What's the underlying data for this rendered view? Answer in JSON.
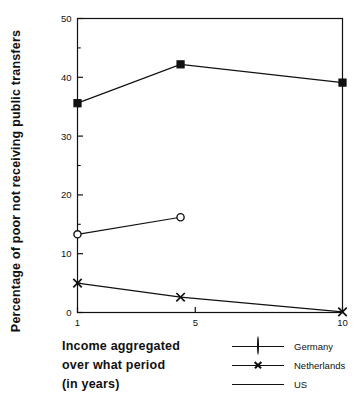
{
  "chart_data": {
    "type": "line",
    "title": "",
    "xlabel": "Income aggregated over what period (in years)",
    "ylabel": "Percentage of poor not receiving public transfers",
    "xlim": [
      1,
      10
    ],
    "ylim": [
      0,
      50
    ],
    "xticks": [
      1,
      5,
      10
    ],
    "xtick_labels": [
      "1",
      "5",
      "10"
    ],
    "yticks": [
      0,
      10,
      20,
      30,
      40,
      50
    ],
    "ytick_labels": [
      "0",
      "10",
      "20",
      "30",
      "40",
      "50"
    ],
    "yminor_ticks": [
      5,
      15,
      25,
      35,
      45
    ],
    "grid": false,
    "legend_position": "bottom-right",
    "series": [
      {
        "name": "Germany",
        "marker": "open-circle",
        "x": [
          1,
          4.5
        ],
        "values": [
          13.3,
          16.2
        ]
      },
      {
        "name": "Netherlands",
        "marker": "cross",
        "x": [
          1,
          4.5,
          10
        ],
        "values": [
          5.0,
          2.6,
          0.1
        ]
      },
      {
        "name": "US",
        "marker": "filled-square",
        "x": [
          1,
          4.5,
          10
        ],
        "values": [
          35.6,
          42.2,
          39.1
        ]
      }
    ]
  },
  "axis": {
    "ylabel": "Percentage of poor not receiving public transfers",
    "xlabel_lines": [
      "Income  aggregated",
      "over  what  period",
      "(in  years)"
    ]
  },
  "legend": {
    "items": [
      {
        "label": "Germany",
        "marker": "open-circle"
      },
      {
        "label": "Netherlands",
        "marker": "cross"
      },
      {
        "label": "US",
        "marker": "filled-square"
      }
    ]
  },
  "colors": {
    "ink": "#111111",
    "background": "#ffffff"
  }
}
